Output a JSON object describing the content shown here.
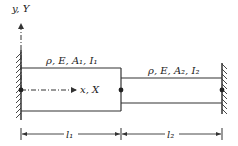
{
  "diagram": {
    "type": "stepped-beam",
    "axis_y_label": "y, Y",
    "axis_x_label": "x, X",
    "segment1": {
      "label": "ρ, E, A₁, I₁",
      "length_label": "l₁"
    },
    "segment2": {
      "label": "ρ, E, A₂, I₂",
      "length_label": "l₂"
    },
    "supports": [
      "fixed-left",
      "fixed-right"
    ],
    "colors": {
      "line": "#333333",
      "background": "#ffffff"
    }
  }
}
